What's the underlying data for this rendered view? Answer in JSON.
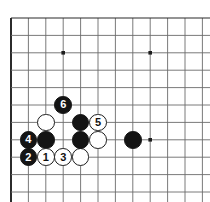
{
  "figure": {
    "kind": "go-board-diagram",
    "board": {
      "background_color": "#ffffff",
      "line_color": "#6b6b6b",
      "edge_color": "#2b2b2b",
      "grid_spacing_px": 17.4,
      "origin_x_px": 11,
      "origin_y_px": 18,
      "columns": 12,
      "rows": 11,
      "edges_drawn": [
        "left",
        "bottom",
        "top"
      ],
      "star_points": [
        {
          "col": 3,
          "row": 2
        },
        {
          "col": 8,
          "row": 2
        },
        {
          "col": 8,
          "row": 7
        }
      ]
    },
    "legend": {
      "black_label": "Black",
      "white_label": "White",
      "numbered_note": "Numbers show move order"
    },
    "stones": [
      {
        "id": "w-a",
        "color": "white",
        "label": "",
        "col": 2,
        "row": 6
      },
      {
        "id": "b-6",
        "color": "black",
        "label": "6",
        "col": 3,
        "row": 5
      },
      {
        "id": "b-4",
        "color": "black",
        "label": "4",
        "col": 1,
        "row": 7
      },
      {
        "id": "b-b",
        "color": "black",
        "label": "",
        "col": 2,
        "row": 7
      },
      {
        "id": "b-2",
        "color": "black",
        "label": "2",
        "col": 1,
        "row": 8
      },
      {
        "id": "w-1",
        "color": "white",
        "label": "1",
        "col": 2,
        "row": 8
      },
      {
        "id": "w-3",
        "color": "white",
        "label": "3",
        "col": 3,
        "row": 8
      },
      {
        "id": "w-c",
        "color": "white",
        "label": "",
        "col": 4,
        "row": 8
      },
      {
        "id": "b-d",
        "color": "black",
        "label": "",
        "col": 4,
        "row": 6
      },
      {
        "id": "b-e",
        "color": "black",
        "label": "",
        "col": 4,
        "row": 7
      },
      {
        "id": "w-5",
        "color": "white",
        "label": "5",
        "col": 5,
        "row": 6
      },
      {
        "id": "w-f",
        "color": "white",
        "label": "",
        "col": 5,
        "row": 7
      },
      {
        "id": "b-g",
        "color": "black",
        "label": "",
        "col": 7,
        "row": 7
      }
    ]
  }
}
